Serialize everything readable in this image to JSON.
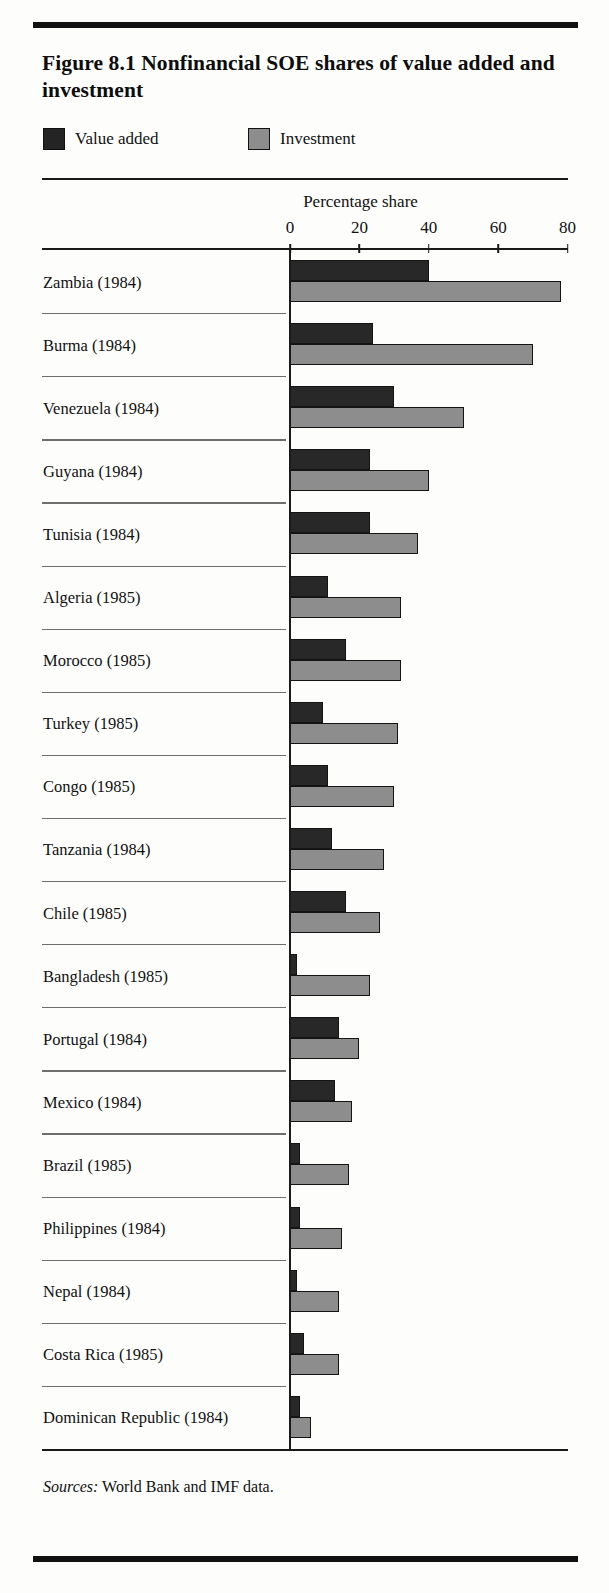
{
  "figure": {
    "title": "Figure 8.1  Nonfinancial SOE shares of value added and investment",
    "sources_prefix": "Sources:",
    "sources_text": "World Bank and IMF data."
  },
  "legend": {
    "items": [
      {
        "label": "Value added",
        "color": "#282828",
        "icon": "legend-swatch-dark"
      },
      {
        "label": "Investment",
        "color": "#8d8d8d",
        "icon": "legend-swatch-gray"
      }
    ]
  },
  "chart_data": {
    "type": "bar",
    "orientation": "horizontal",
    "title": "Figure 8.1  Nonfinancial SOE shares of value added and investment",
    "xlabel": "Percentage share",
    "ylabel": "",
    "xlim": [
      0,
      80
    ],
    "xticks": [
      0,
      20,
      40,
      60,
      80
    ],
    "ticklabels": [
      "0",
      "20",
      "40",
      "60",
      "80"
    ],
    "grid": false,
    "legend_position": "top-left",
    "categories": [
      "Zambia (1984)",
      "Burma (1984)",
      "Venezuela (1984)",
      "Guyana (1984)",
      "Tunisia (1984)",
      "Algeria (1985)",
      "Morocco (1985)",
      "Turkey (1985)",
      "Congo (1985)",
      "Tanzania (1984)",
      "Chile (1985)",
      "Bangladesh (1985)",
      "Portugal (1984)",
      "Mexico (1984)",
      "Brazil (1985)",
      "Philippines (1984)",
      "Nepal (1984)",
      "Costa Rica (1985)",
      "Dominican Republic (1984)"
    ],
    "series": [
      {
        "name": "Value added",
        "color": "#282828",
        "values": [
          40,
          24,
          30,
          23,
          23,
          11,
          16,
          9.5,
          11,
          12,
          16,
          2,
          14,
          13,
          3,
          3,
          2,
          4,
          3
        ]
      },
      {
        "name": "Investment",
        "color": "#8d8d8d",
        "values": [
          78,
          70,
          50,
          40,
          37,
          32,
          32,
          31,
          30,
          27,
          26,
          23,
          20,
          18,
          17,
          15,
          14,
          14,
          6
        ]
      }
    ]
  }
}
